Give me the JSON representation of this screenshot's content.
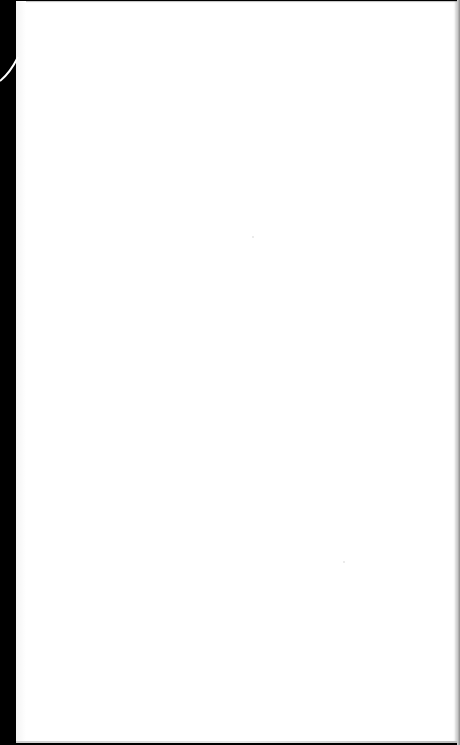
{
  "scene": {
    "description": "Blank white sheet against a black background",
    "colors": {
      "background": "#000000",
      "sheet": "#ffffff"
    }
  }
}
